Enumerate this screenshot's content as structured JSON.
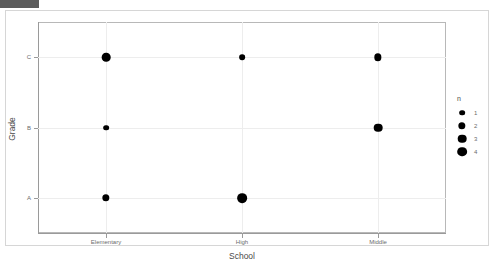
{
  "chrome": {
    "stub_color": "#5c5c5c"
  },
  "chart_data": {
    "type": "scatter",
    "title": "",
    "subtitle": "",
    "xlabel": "School",
    "ylabel": "Grade",
    "categories_x": [
      "Elementary",
      "High",
      "Middle"
    ],
    "categories_y": [
      "A",
      "B",
      "C"
    ],
    "grid": true,
    "size_encoding": "n",
    "points": [
      {
        "x": "Elementary",
        "y": "C",
        "n": 3
      },
      {
        "x": "Elementary",
        "y": "B",
        "n": 1
      },
      {
        "x": "Elementary",
        "y": "A",
        "n": 2
      },
      {
        "x": "High",
        "y": "C",
        "n": 1
      },
      {
        "x": "High",
        "y": "A",
        "n": 4
      },
      {
        "x": "Middle",
        "y": "C",
        "n": 2
      },
      {
        "x": "Middle",
        "y": "B",
        "n": 3
      }
    ],
    "legend": {
      "position": "right",
      "title": "n",
      "entries": [
        {
          "label": "1",
          "n": 1
        },
        {
          "label": "2",
          "n": 2
        },
        {
          "label": "3",
          "n": 3
        },
        {
          "label": "4",
          "n": 4
        }
      ]
    },
    "colors": {
      "point": "#000000",
      "gridline": "#ededed",
      "axis": "#9a9a9a",
      "panel_border": "#b8b8b8",
      "container_border": "#d6d6d6",
      "background": "#ffffff",
      "tick_text": "#6b6b6b",
      "axis_title_text": "#4a4a4a"
    }
  }
}
